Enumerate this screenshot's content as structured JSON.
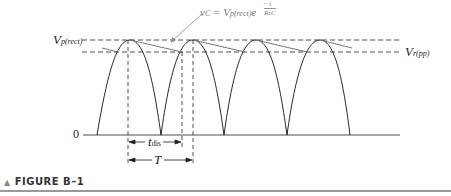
{
  "figure": {
    "caption": "FIGURE B–1",
    "labels": {
      "v_peak": "V",
      "v_peak_sub": "p(rect)",
      "v_ripple": "V",
      "v_ripple_sub": "r(pp)",
      "zero": "0",
      "t_dis": "t",
      "t_dis_sub": "dis",
      "period": "T",
      "equation": "v",
      "equation_sub": "C",
      "equation_mid": " = V",
      "equation_mid_sub": "p(rect)",
      "equation_e": "e",
      "equation_exp_num": "t",
      "equation_exp_den": "R",
      "equation_exp_den_sub": "L",
      "equation_exp_den_tail": "C"
    },
    "colors": {
      "waveform": "#111111",
      "ripple": "#777777",
      "caption_bar": "#999999"
    }
  }
}
